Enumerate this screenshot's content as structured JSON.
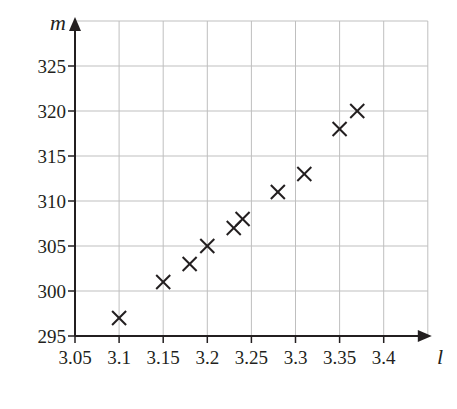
{
  "chart_data": {
    "type": "scatter",
    "title": "",
    "xlabel": "l",
    "ylabel": "m",
    "xlim": [
      3.05,
      3.45
    ],
    "ylim": [
      295,
      330
    ],
    "grid": true,
    "legend": null,
    "x_ticks": [
      3.05,
      3.1,
      3.15,
      3.2,
      3.25,
      3.3,
      3.35,
      3.4
    ],
    "x_tick_labels": [
      "3.05",
      "3.1",
      "3.15",
      "3.2",
      "3.25",
      "3.3",
      "3.35",
      "3.4"
    ],
    "y_ticks": [
      295,
      300,
      305,
      310,
      315,
      320,
      325
    ],
    "y_tick_labels": [
      "295",
      "300",
      "305",
      "310",
      "315",
      "320",
      "325"
    ],
    "marker": "x",
    "series": [
      {
        "name": "data",
        "points": [
          {
            "x": 3.1,
            "y": 297
          },
          {
            "x": 3.15,
            "y": 301
          },
          {
            "x": 3.18,
            "y": 303
          },
          {
            "x": 3.2,
            "y": 305
          },
          {
            "x": 3.23,
            "y": 307
          },
          {
            "x": 3.24,
            "y": 308
          },
          {
            "x": 3.28,
            "y": 311
          },
          {
            "x": 3.31,
            "y": 313
          },
          {
            "x": 3.35,
            "y": 318
          },
          {
            "x": 3.37,
            "y": 320
          }
        ]
      }
    ]
  },
  "colors": {
    "axis": "#231f20",
    "grid": "#bfbfbf",
    "marker": "#231f20"
  }
}
